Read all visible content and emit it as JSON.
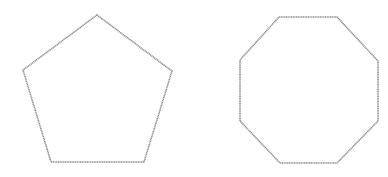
{
  "diagram": {
    "background": "#ffffff",
    "stroke_color": "#8f8f8f",
    "shapes": [
      {
        "name": "pentagon",
        "sides": 5,
        "points": "97,15 172,71 144,162 51,162 23,70"
      },
      {
        "name": "octagon",
        "sides": 8,
        "points": "279,17 337,17 378,61 378,121 337,163 280,163 240,121 240,60"
      }
    ]
  }
}
